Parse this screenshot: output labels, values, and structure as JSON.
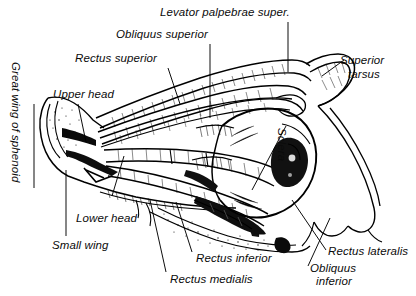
{
  "figure": {
    "style": "black-and-white engraved line drawing with hatching",
    "background_color": "#ffffff",
    "ink_color": "#000000"
  },
  "labels": {
    "levator": "Levator palpebrae super.",
    "obliquus_superior": "Obliquus superior",
    "rectus_superior": "Rectus superior",
    "upper_head": "Upper head",
    "superior_tarsus_line1": "Superior",
    "superior_tarsus_line2": "tarsus",
    "great_wing": "Great wing of sphenoid",
    "sclera": "Sclera",
    "lower_head": "Lower head",
    "small_wing": "Small wing",
    "rectus_inferior": "Rectus inferior",
    "rectus_medialis": "Rectus medialis",
    "rectus_lateralis": "Rectus lateralis",
    "obliquus_inferior_line1": "Obliquus",
    "obliquus_inferior_line2": "inferior"
  }
}
